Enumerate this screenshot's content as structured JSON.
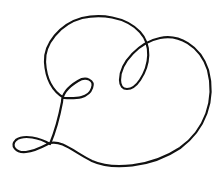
{
  "image": {
    "description": "Single continuous-line drawing of a looping heart shape with small loops",
    "background_color": "#ffffff",
    "stroke_color": "#111111",
    "stroke_width": 2.2
  }
}
